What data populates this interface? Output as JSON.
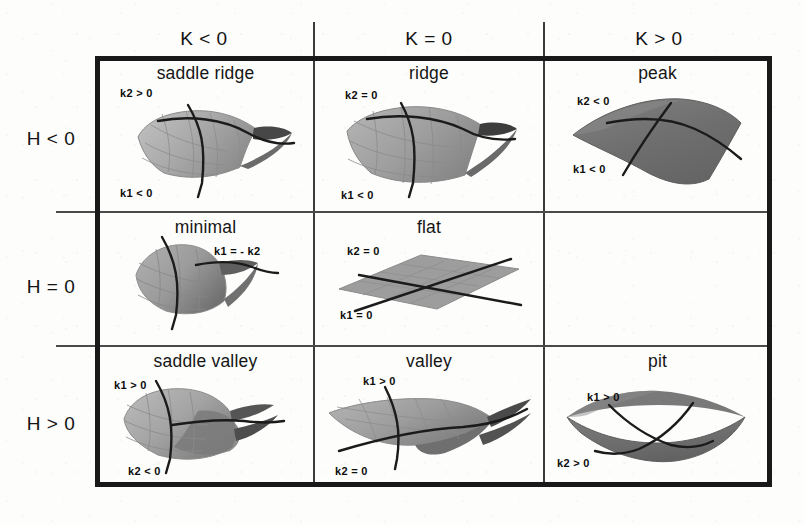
{
  "figure": {
    "type": "classification-table",
    "columns": [
      "K < 0",
      "K = 0",
      "K > 0"
    ],
    "rows": [
      "H < 0",
      "H = 0",
      "H > 0"
    ],
    "colors": {
      "outer_border": "#191919",
      "inner_divider": "#4a4a4a",
      "background": "#fdfdfc",
      "surface_light": "#b9b9b9",
      "surface_mid": "#9a9a9a",
      "surface_dark": "#6f6f6f",
      "surface_darkest": "#3a3a3a",
      "curve_line": "#1b1b1b",
      "text": "#121212"
    }
  },
  "cells": [
    {
      "id": "saddle-ridge",
      "row": "H < 0",
      "col": "K < 0",
      "title": "saddle ridge",
      "labels": [
        {
          "text": "k2 > 0",
          "pos": "upper-left"
        },
        {
          "text": "k1 < 0",
          "pos": "lower-left"
        }
      ]
    },
    {
      "id": "ridge",
      "row": "H < 0",
      "col": "K = 0",
      "title": "ridge",
      "labels": [
        {
          "text": "k2 = 0",
          "pos": "upper-left"
        },
        {
          "text": "k1 < 0",
          "pos": "lower-left"
        }
      ]
    },
    {
      "id": "peak",
      "row": "H < 0",
      "col": "K > 0",
      "title": "peak",
      "labels": [
        {
          "text": "k2 < 0",
          "pos": "upper-left"
        },
        {
          "text": "k1 < 0",
          "pos": "lower-left"
        }
      ]
    },
    {
      "id": "minimal",
      "row": "H = 0",
      "col": "K < 0",
      "title": "minimal",
      "labels": [
        {
          "text": "k1 = - k2",
          "pos": "upper-right"
        }
      ]
    },
    {
      "id": "flat",
      "row": "H = 0",
      "col": "K = 0",
      "title": "flat",
      "labels": [
        {
          "text": "k2 = 0",
          "pos": "upper-left"
        },
        {
          "text": "k1 = 0",
          "pos": "lower-left"
        }
      ]
    },
    {
      "id": "empty-h0-kpos",
      "row": "H = 0",
      "col": "K > 0",
      "title": "",
      "labels": []
    },
    {
      "id": "saddle-valley",
      "row": "H > 0",
      "col": "K < 0",
      "title": "saddle valley",
      "labels": [
        {
          "text": "k1 > 0",
          "pos": "upper-left"
        },
        {
          "text": "k2 < 0",
          "pos": "lower-left"
        }
      ]
    },
    {
      "id": "valley",
      "row": "H > 0",
      "col": "K = 0",
      "title": "valley",
      "labels": [
        {
          "text": "k1 > 0",
          "pos": "upper-left"
        },
        {
          "text": "k2 = 0",
          "pos": "lower-left"
        }
      ]
    },
    {
      "id": "pit",
      "row": "H > 0",
      "col": "K > 0",
      "title": "pit",
      "labels": [
        {
          "text": "k1 > 0",
          "pos": "upper-left"
        },
        {
          "text": "k2 > 0",
          "pos": "lower-left"
        }
      ]
    }
  ]
}
